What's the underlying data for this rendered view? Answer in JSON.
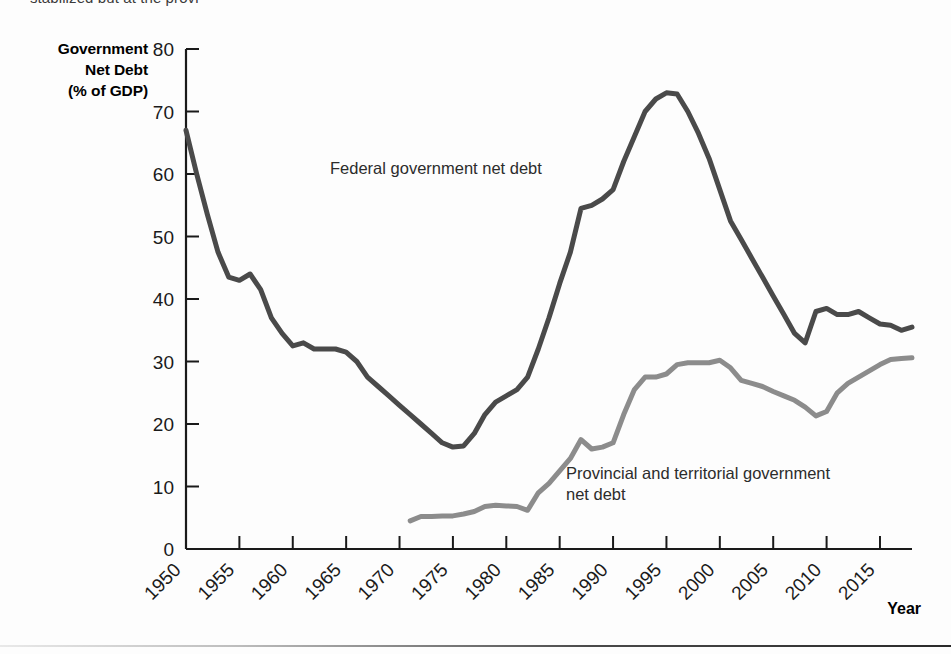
{
  "page": {
    "top_caption": "stabilized but at the provi",
    "bottom_rule": true
  },
  "chart_data": {
    "type": "line",
    "title": "",
    "ylabel": "Government Net Debt (% of GDP)",
    "ylabel_lines": [
      "Government",
      "Net Debt",
      "(% of GDP)"
    ],
    "xlabel": "Year",
    "xlim": [
      1950,
      2018
    ],
    "ylim": [
      0,
      80
    ],
    "yticks": [
      0,
      10,
      20,
      30,
      40,
      50,
      60,
      70,
      80
    ],
    "xticks": [
      1950,
      1955,
      1960,
      1965,
      1970,
      1975,
      1980,
      1985,
      1990,
      1995,
      2000,
      2005,
      2010,
      2015
    ],
    "xtick_labels": [
      "1950",
      "1955",
      "1960",
      "1965",
      "1970",
      "1975",
      "1980",
      "1985",
      "1990",
      "1995",
      "2000",
      "2005",
      "2010",
      "2015"
    ],
    "ytick_labels": [
      "0",
      "10",
      "20",
      "30",
      "40",
      "50",
      "60",
      "70",
      "80"
    ],
    "grid": false,
    "legend": "inline-annotations",
    "annotations": [
      {
        "name": "federal-label",
        "text": "Federal government net debt",
        "x": 1975,
        "y": 62
      },
      {
        "name": "provincial-label",
        "text": "Provincial and territorial government\nnet debt",
        "x": 1991,
        "y": 15
      }
    ],
    "series": [
      {
        "name": "Federal government net debt",
        "color": "#4a4a4a",
        "x": [
          1950,
          1951,
          1952,
          1953,
          1954,
          1955,
          1956,
          1957,
          1958,
          1959,
          1960,
          1961,
          1962,
          1963,
          1964,
          1965,
          1966,
          1967,
          1968,
          1969,
          1970,
          1971,
          1972,
          1973,
          1974,
          1975,
          1976,
          1977,
          1978,
          1979,
          1980,
          1981,
          1982,
          1983,
          1984,
          1985,
          1986,
          1987,
          1988,
          1989,
          1990,
          1991,
          1992,
          1993,
          1994,
          1995,
          1996,
          1997,
          1998,
          1999,
          2000,
          2001,
          2002,
          2003,
          2004,
          2005,
          2006,
          2007,
          2008,
          2009,
          2010,
          2011,
          2012,
          2013,
          2014,
          2015,
          2016,
          2017,
          2018
        ],
        "y": [
          67.0,
          60.0,
          53.5,
          47.5,
          43.5,
          43.0,
          44.0,
          41.5,
          37.0,
          34.5,
          32.5,
          33.0,
          32.0,
          32.0,
          32.0,
          31.5,
          30.0,
          27.5,
          26.0,
          24.5,
          23.0,
          21.5,
          20.0,
          18.5,
          17.0,
          16.3,
          16.5,
          18.5,
          21.5,
          23.5,
          24.5,
          25.5,
          27.5,
          32.0,
          37.0,
          42.5,
          47.5,
          54.5,
          55.0,
          56.0,
          57.5,
          62.0,
          66.0,
          70.0,
          72.0,
          73.0,
          72.8,
          70.0,
          66.5,
          62.5,
          57.5,
          52.5,
          49.5,
          46.5,
          43.5,
          40.5,
          37.5,
          34.5,
          33.0,
          38.0,
          38.5,
          37.5,
          37.5,
          38.0,
          37.0,
          36.0,
          35.8,
          35.0,
          35.5
        ]
      },
      {
        "name": "Provincial and territorial government net debt",
        "color": "#8c8c8c",
        "x": [
          1971,
          1972,
          1973,
          1974,
          1975,
          1976,
          1977,
          1978,
          1979,
          1980,
          1981,
          1982,
          1983,
          1984,
          1985,
          1986,
          1987,
          1988,
          1989,
          1990,
          1991,
          1992,
          1993,
          1994,
          1995,
          1996,
          1997,
          1998,
          1999,
          2000,
          2001,
          2002,
          2003,
          2004,
          2005,
          2006,
          2007,
          2008,
          2009,
          2010,
          2011,
          2012,
          2013,
          2014,
          2015,
          2016,
          2017,
          2018
        ],
        "y": [
          4.5,
          5.2,
          5.2,
          5.3,
          5.3,
          5.6,
          6.0,
          6.8,
          7.0,
          6.9,
          6.8,
          6.2,
          9.0,
          10.5,
          12.5,
          14.5,
          17.5,
          16.0,
          16.3,
          17.0,
          21.5,
          25.5,
          27.5,
          27.5,
          28.0,
          29.5,
          29.8,
          29.8,
          29.8,
          30.2,
          29.0,
          27.0,
          26.5,
          26.0,
          25.2,
          24.5,
          23.8,
          22.7,
          21.3,
          22.0,
          25.0,
          26.5,
          27.5,
          28.5,
          29.5,
          30.3,
          30.5,
          30.6
        ]
      }
    ]
  },
  "icons": {}
}
